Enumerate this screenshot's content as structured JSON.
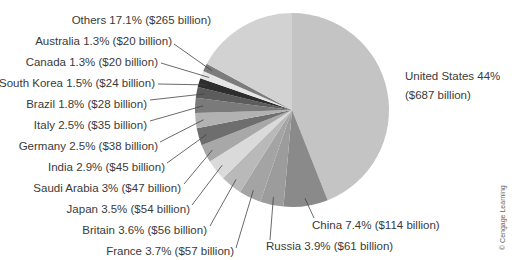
{
  "chart_data": {
    "type": "pie",
    "title": "",
    "unit": "billion USD",
    "start_angle_deg": 0,
    "direction": "clockwise",
    "slices": [
      {
        "name": "United States",
        "percent": 44,
        "value": 687,
        "label": "United States 44%",
        "label2": "($687 billion)",
        "color": "#c4c4c4"
      },
      {
        "name": "China",
        "percent": 7.4,
        "value": 114,
        "label": "China 7.4% ($114 billion)",
        "color": "#8a8a8a"
      },
      {
        "name": "Russia",
        "percent": 3.9,
        "value": 61,
        "label": "Russia 3.9% ($61 billion)",
        "color": "#9c9c9c"
      },
      {
        "name": "France",
        "percent": 3.7,
        "value": 57,
        "label": "France 3.7% ($57 billion)",
        "color": "#a4a4a4"
      },
      {
        "name": "Britain",
        "percent": 3.6,
        "value": 56,
        "label": "Britain 3.6% ($56 billion)",
        "color": "#b9b9b9"
      },
      {
        "name": "Japan",
        "percent": 3.5,
        "value": 54,
        "label": "Japan 3.5% ($54 billion)",
        "color": "#dadada"
      },
      {
        "name": "Saudi Arabia",
        "percent": 3,
        "value": 47,
        "label": "Saudi Arabia 3% ($47 billion)",
        "color": "#a8a8a8"
      },
      {
        "name": "India",
        "percent": 2.9,
        "value": 45,
        "label": "India 2.9% ($45 billion)",
        "color": "#6e6e6e"
      },
      {
        "name": "Germany",
        "percent": 2.5,
        "value": 38,
        "label": "Germany 2.5% ($38 billion)",
        "color": "#b2b2b2"
      },
      {
        "name": "Italy",
        "percent": 2.5,
        "value": 35,
        "label": "Italy 2.5% ($35 billion)",
        "color": "#7a7a7a"
      },
      {
        "name": "Brazil",
        "percent": 1.8,
        "value": 28,
        "label": "Brazil 1.8% ($28 billion)",
        "color": "#5c5c5c"
      },
      {
        "name": "South Korea",
        "percent": 1.5,
        "value": 24,
        "label": "South Korea 1.5% ($24 billion)",
        "color": "#2e2e2e"
      },
      {
        "name": "Canada",
        "percent": 1.3,
        "value": 20,
        "label": "Canada 1.3% ($20 billion)",
        "color": "#e6e6e6"
      },
      {
        "name": "Australia",
        "percent": 1.3,
        "value": 20,
        "label": "Australia 1.3% ($20 billion)",
        "color": "#7c7c7c"
      },
      {
        "name": "Others",
        "percent": 17.1,
        "value": 265,
        "label": "Others 17.1% ($265 billion)",
        "color": "#d2d2d2"
      }
    ],
    "legend": "none (direct labels with leader lines)"
  },
  "credit": "© Cengage Learning"
}
